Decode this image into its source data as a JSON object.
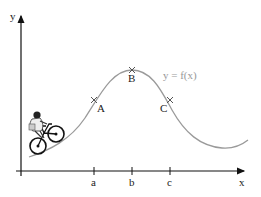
{
  "diagram": {
    "axes": {
      "x_label": "x",
      "y_label": "y"
    },
    "curve": {
      "label": "y = f(x)",
      "color": "#9a9a9a"
    },
    "points": [
      {
        "name": "A",
        "x_tick": "a"
      },
      {
        "name": "B",
        "x_tick": "b"
      },
      {
        "name": "C",
        "x_tick": "c"
      }
    ],
    "illustration": "cyclist riding uphill on the curve"
  }
}
